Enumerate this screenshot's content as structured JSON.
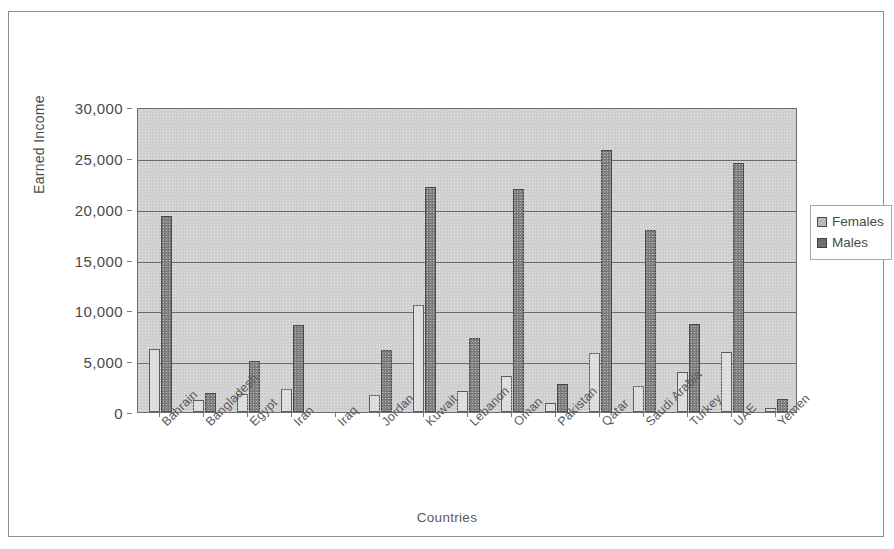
{
  "chart_data": {
    "type": "bar",
    "title": "",
    "xlabel": "Countries",
    "ylabel": "Earned Income",
    "ylim": [
      0,
      30000
    ],
    "ytick_labels": [
      "30,000",
      "25,000",
      "20,000",
      "15,000",
      "10,000",
      "5,000",
      "0"
    ],
    "ytick_values": [
      30000,
      25000,
      20000,
      15000,
      10000,
      5000,
      0
    ],
    "grid": true,
    "legend_position": "right",
    "categories": [
      "Bahrain",
      "Bangladesh",
      "Egypt",
      "Iran",
      "Iraq",
      "Jordan",
      "Kuwait",
      "Lebanon",
      "Oman",
      "Pakistan",
      "Qatar",
      "Saudi Arabia",
      "Turkey",
      "UAE",
      "Yemen"
    ],
    "series": [
      {
        "name": "Females",
        "color": "#dcdcdc",
        "values": [
          6200,
          1200,
          1800,
          2300,
          0,
          1700,
          10500,
          2100,
          3500,
          850,
          5800,
          2600,
          3900,
          5900,
          400
        ]
      },
      {
        "name": "Males",
        "color": "#7b7b7b",
        "values": [
          19300,
          1900,
          5000,
          8600,
          0,
          6100,
          22100,
          7300,
          21900,
          2800,
          25800,
          17900,
          8700,
          24500,
          1300
        ]
      }
    ]
  },
  "legend": {
    "items": [
      {
        "label": "Females",
        "swatch": "female-swatch-icon"
      },
      {
        "label": "Males",
        "swatch": "male-swatch-icon"
      }
    ]
  }
}
